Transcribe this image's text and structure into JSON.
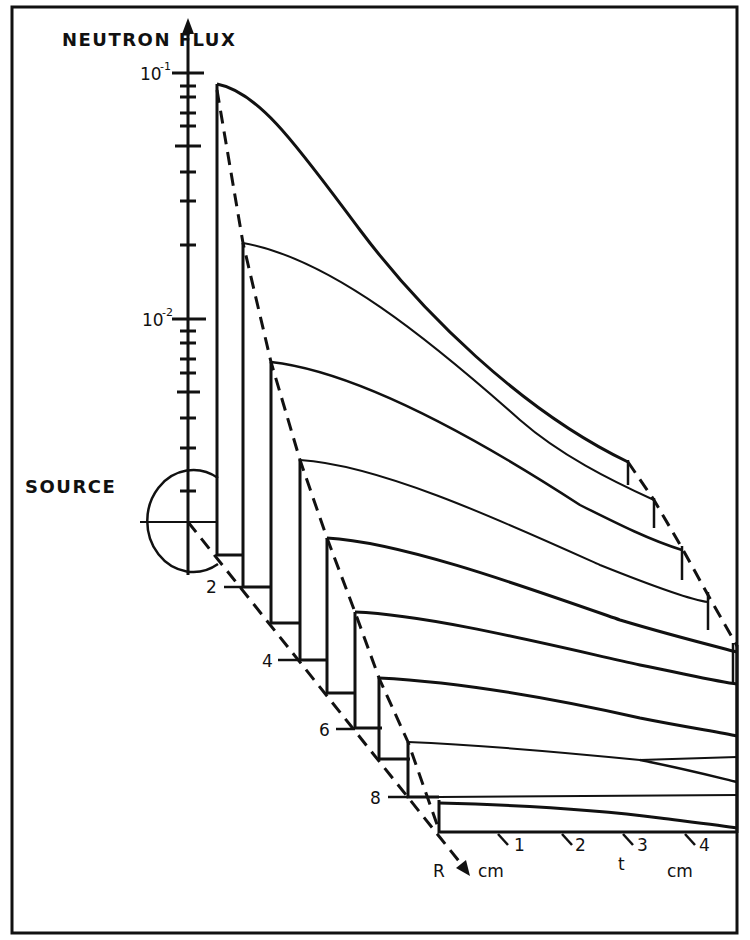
{
  "figure": {
    "y_axis_label": "NEUTRON FLUX",
    "y_ticks": [
      {
        "base": "10",
        "exp": "-1",
        "value": 0.1
      },
      {
        "base": "10",
        "exp": "-2",
        "value": 0.01
      }
    ],
    "source_label": "SOURCE",
    "r_axis": {
      "label": "R",
      "unit": "cm",
      "ticks": [
        "2",
        "4",
        "6",
        "8"
      ]
    },
    "t_axis": {
      "label": "t",
      "unit": "cm",
      "ticks": [
        "1",
        "2",
        "3",
        "4"
      ]
    },
    "colors": {
      "ink": "#111111",
      "paper": "#ffffff"
    }
  }
}
